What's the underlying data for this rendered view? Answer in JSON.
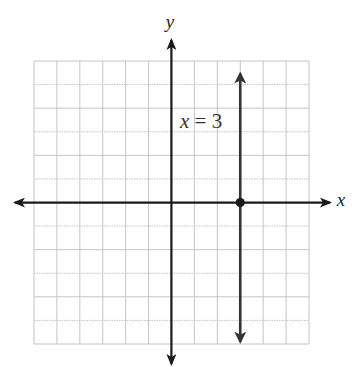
{
  "chart_data": {
    "type": "line",
    "title": "",
    "xlabel": "x",
    "ylabel": "y",
    "xlim": [
      -6,
      6
    ],
    "ylim": [
      -6,
      6
    ],
    "grid": true,
    "grid_step": 1,
    "tick_labels": false,
    "series": [
      {
        "name": "x = 3",
        "kind": "vertical-line",
        "x": 3,
        "y_range": [
          -5.9,
          5.3
        ],
        "arrows": "both",
        "label": "x = 3"
      }
    ],
    "points": [
      {
        "x": 3,
        "y": 0,
        "label": "",
        "style": "filled-dot"
      }
    ],
    "annotations": [
      {
        "text": "x = 3",
        "x": 1.5,
        "y": 3.3
      }
    ]
  },
  "labels": {
    "x_axis": "x",
    "y_axis": "y",
    "line_label_var": "x",
    "line_label_rest": " = 3"
  },
  "colors": {
    "axis": "#1a1a1a",
    "line": "#333333",
    "grid": "#c4c4c4",
    "background": "#ffffff"
  }
}
